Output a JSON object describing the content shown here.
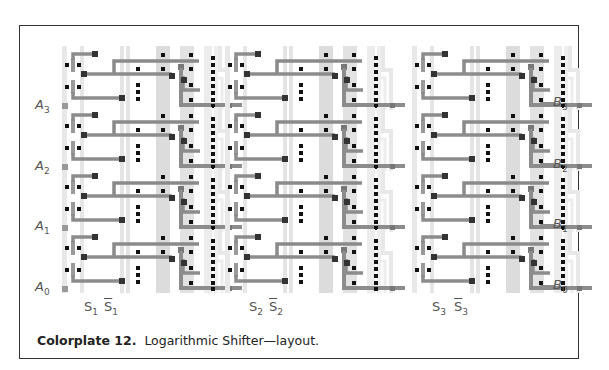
{
  "figure": {
    "caption_label": "Colorplate 12.",
    "caption_text": "Logarithmic Shifter—layout.",
    "inputs": [
      {
        "name": "A",
        "sub": "3"
      },
      {
        "name": "A",
        "sub": "2"
      },
      {
        "name": "A",
        "sub": "1"
      },
      {
        "name": "A",
        "sub": "0"
      }
    ],
    "outputs": [
      {
        "name": "B",
        "sub": "3"
      },
      {
        "name": "B",
        "sub": "2"
      },
      {
        "name": "B",
        "sub": "1"
      },
      {
        "name": "B",
        "sub": "0"
      }
    ],
    "selects": [
      {
        "name": "S",
        "sub": "1",
        "bar_name": "S",
        "bar_sub": "1"
      },
      {
        "name": "S",
        "sub": "2",
        "bar_name": "S",
        "bar_sub": "2"
      },
      {
        "name": "S",
        "sub": "3",
        "bar_name": "S",
        "bar_sub": "3"
      }
    ],
    "stages": 3,
    "bits": 4
  },
  "colors": {
    "frame": "#333333",
    "metal": "#8c8c8c",
    "poly_light": "#e6e6e6",
    "diffusion": "#d2d2d2",
    "contact": "#111111",
    "label": "#555555"
  }
}
